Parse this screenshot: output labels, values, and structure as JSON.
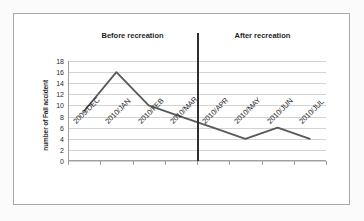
{
  "chart_data": {
    "type": "line",
    "title": "",
    "xlabel": "",
    "ylabel": "number of Fall accident",
    "categories": [
      "2009/DEC",
      "2010/JAN",
      "2010/FEB",
      "2010/MAR",
      "2010/APR",
      "2010/MAY",
      "2010/JUN",
      "2010/JUL"
    ],
    "series": [
      {
        "name": "number of Fall accident",
        "values": [
          9,
          16,
          10,
          8,
          6,
          4,
          6,
          4
        ],
        "color": "#595959"
      }
    ],
    "ylim": [
      0,
      18
    ],
    "ytick_step": 2,
    "yticks": [
      0,
      2,
      4,
      6,
      8,
      10,
      12,
      14,
      16,
      18
    ],
    "grid": true,
    "legend": "none",
    "annotations": [
      {
        "text": "Before recreation",
        "position": "top-left-region"
      },
      {
        "text": "After recreation",
        "position": "top-right-region"
      }
    ],
    "divider": {
      "label": "recreation-event",
      "after_category": "2010/APR",
      "color": "#2f2f2f"
    }
  },
  "figure": {
    "background": "#ffffff",
    "border_color": "#a9a9a9",
    "gridline_color": "#d3d3d3",
    "axis_color": "#a0a0a0"
  }
}
